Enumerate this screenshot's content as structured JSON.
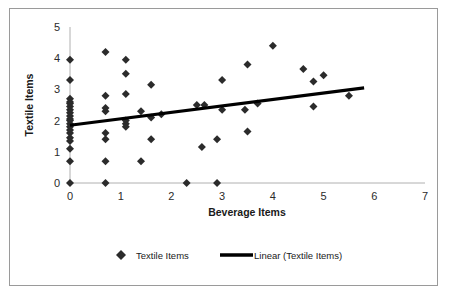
{
  "chart_data": {
    "type": "scatter",
    "title": "",
    "xlabel": "Beverage Items",
    "ylabel": "Textile Items",
    "xlim": [
      0,
      7
    ],
    "ylim": [
      0,
      5
    ],
    "xticks": [
      "0",
      "1",
      "2",
      "3",
      "4",
      "5",
      "6",
      "7"
    ],
    "yticks": [
      "0",
      "1",
      "2",
      "3",
      "4",
      "5"
    ],
    "xtick_values": [
      0,
      1,
      2,
      3,
      4,
      5,
      6,
      7
    ],
    "ytick_values": [
      0,
      1,
      2,
      3,
      4,
      5
    ],
    "grid": false,
    "legend_position": "bottom",
    "legend": [
      {
        "label": "Textile Items",
        "marker": "diamond",
        "color": "#2b2b2b"
      },
      {
        "label": "Linear (Textile Items)",
        "marker": "line",
        "color": "#000000"
      }
    ],
    "series": [
      {
        "name": "Textile Items",
        "marker": "diamond",
        "color": "#2b2b2b",
        "points": [
          [
            0.0,
            0.0
          ],
          [
            0.0,
            0.7
          ],
          [
            0.0,
            1.1
          ],
          [
            0.0,
            1.35
          ],
          [
            0.0,
            1.45
          ],
          [
            0.0,
            1.6
          ],
          [
            0.0,
            1.7
          ],
          [
            0.0,
            1.8
          ],
          [
            0.0,
            1.9
          ],
          [
            0.0,
            2.0
          ],
          [
            0.0,
            2.05
          ],
          [
            0.0,
            2.15
          ],
          [
            0.0,
            2.25
          ],
          [
            0.0,
            2.35
          ],
          [
            0.0,
            2.45
          ],
          [
            0.0,
            2.55
          ],
          [
            0.0,
            2.6
          ],
          [
            0.0,
            2.7
          ],
          [
            0.0,
            3.3
          ],
          [
            0.0,
            3.95
          ],
          [
            0.7,
            0.0
          ],
          [
            0.7,
            0.7
          ],
          [
            0.7,
            1.4
          ],
          [
            0.7,
            1.6
          ],
          [
            0.7,
            2.3
          ],
          [
            0.7,
            2.4
          ],
          [
            0.7,
            2.8
          ],
          [
            0.7,
            4.2
          ],
          [
            1.1,
            1.8
          ],
          [
            1.1,
            1.9
          ],
          [
            1.1,
            2.0
          ],
          [
            1.1,
            2.85
          ],
          [
            1.1,
            3.5
          ],
          [
            1.1,
            3.95
          ],
          [
            1.4,
            0.7
          ],
          [
            1.4,
            2.3
          ],
          [
            1.6,
            1.4
          ],
          [
            1.6,
            2.1
          ],
          [
            1.6,
            3.15
          ],
          [
            1.8,
            2.2
          ],
          [
            2.3,
            0.0
          ],
          [
            2.5,
            2.5
          ],
          [
            2.6,
            1.15
          ],
          [
            2.65,
            2.5
          ],
          [
            2.9,
            0.0
          ],
          [
            2.9,
            1.4
          ],
          [
            3.0,
            2.35
          ],
          [
            3.0,
            3.3
          ],
          [
            3.45,
            2.35
          ],
          [
            3.5,
            1.65
          ],
          [
            3.5,
            3.8
          ],
          [
            3.7,
            2.55
          ],
          [
            4.0,
            4.4
          ],
          [
            4.6,
            3.65
          ],
          [
            4.8,
            2.45
          ],
          [
            4.8,
            3.25
          ],
          [
            5.0,
            3.45
          ],
          [
            5.5,
            2.8
          ]
        ]
      }
    ],
    "trendline": {
      "name": "Linear (Textile Items)",
      "color": "#000000",
      "x_start": 0.0,
      "y_start": 1.85,
      "x_end": 5.8,
      "y_end": 3.05,
      "slope": 0.207,
      "intercept": 1.85
    }
  }
}
